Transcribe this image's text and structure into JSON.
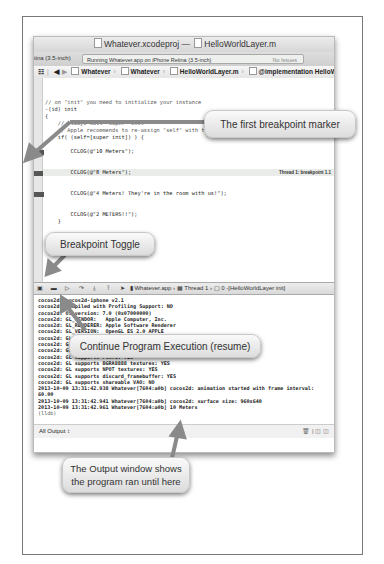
{
  "window": {
    "title_project": "Whatever.xcodeproj",
    "title_sep": "—",
    "title_file": "HelloWorldLayer.m",
    "scheme_label": "tina (3.5-inch)",
    "status_text": "Running Whatever.app on iPhone Retina (3.5-inch)",
    "issues_text": "No Issues"
  },
  "jumpbar": {
    "items": [
      "Whatever",
      "Whatever",
      "HelloWorldLayer.m",
      "@implementation HelloWorldLayer"
    ]
  },
  "code": {
    "lines": [
      "// on \"init\" you need to initialize your instance",
      "-(id) init",
      "{",
      "    // always call \"super\" init",
      "    // Apple recommends to re-assign \"self\" with the \"super's\" return value",
      "    if( (self=[super init]) ) {",
      "",
      "        CCLOG(@\"10 Meters\");",
      "",
      "",
      "        CCLOG(@\"8 Meters\");",
      "",
      "",
      "        CCLOG(@\"4 Meters! They're in the room with us!\");",
      "",
      "",
      "        CCLOG(@\"2 METERS!!\");",
      "    }",
      "",
      "    return self;",
      "}",
      "",
      "",
      "",
      "",
      "",
      "// on \"dealloc\" you need to release all your retained objects",
      "- (void) dealloc"
    ],
    "thread_label": "Thread 1: breakpoint 1.1"
  },
  "debugbar": {
    "app": "Whatever.app",
    "thread": "Thread 1",
    "frame": "0 -[HelloWorldLayer init]"
  },
  "console": {
    "lines": [
      "cocos2d: cocos2d-iphone v2.1",
      "cocos2d: compiled with Profiling Support: NO",
      "cocos2d: OS version: 7.0 (0x07000000)",
      "cocos2d: GL_VENDOR:   Apple Computer, Inc.",
      "cocos2d: GL_RENDERER: Apple Software Renderer",
      "cocos2d: GL_VERSION:  OpenGL ES 2.0 APPLE",
      "cocos2d: GL_MAX_TEXTURE_SIZE: 4096",
      "cocos2d: GL_MAX_TEXTURE_UNITS: 8",
      "cocos2d: GL_MAX_SAMPLES: 4",
      "cocos2d: GL supports PVRTC: YES",
      "cocos2d: GL supports BGRA8888 textures: YES",
      "cocos2d: GL supports NPOT textures: YES",
      "cocos2d: GL supports discard_framebuffer: YES",
      "cocos2d: GL supports shareable VAO: NO",
      "2013-10-09 13:31:42.938 Whatever[7604:a0b] cocos2d: animation started with frame interval:",
      "60.00",
      "2013-10-09 13:31:42.941 Whatever[7604:a0b] cocos2d: surface size: 960x640",
      "2013-10-09 13:31:42.961 Whatever[7604:a0b] 10 Meters"
    ],
    "prompt": "(lldb)",
    "output_selector": "All Output ↕",
    "footer_icons": "🗑 | ◫ ◫"
  },
  "callouts": {
    "breakpoint_marker": "The first breakpoint marker",
    "breakpoint_toggle": "Breakpoint Toggle",
    "continue": "Continue Program Execution (resume)",
    "output": "The Output window shows the program ran until here"
  },
  "colors": {
    "arrow": "#888888",
    "breakpoint": "#555555",
    "callout_bg": "#eeeeee"
  }
}
